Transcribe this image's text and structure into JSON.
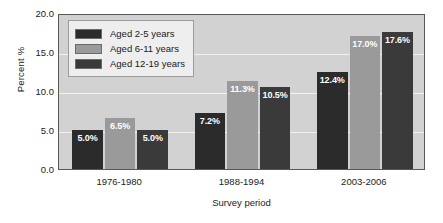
{
  "chart_data": {
    "type": "bar",
    "title": "",
    "xlabel": "Survey period",
    "ylabel": "Percent %",
    "categories": [
      "1976-1980",
      "1988-1994",
      "2003-2006"
    ],
    "series": [
      {
        "name": "Aged 2-5 years",
        "color": "#2b2b2b",
        "values": [
          5.0,
          7.2,
          12.4
        ],
        "labels": [
          "5.0%",
          "7.2%",
          "12.4%"
        ]
      },
      {
        "name": "Aged 6-11 years",
        "color": "#9a9a9a",
        "values": [
          6.5,
          11.3,
          17.0
        ],
        "labels": [
          "6.5%",
          "11.3%",
          "17.0%"
        ]
      },
      {
        "name": "Aged 12-19 years",
        "color": "#3a3a3a",
        "values": [
          5.0,
          10.5,
          17.6
        ],
        "labels": [
          "5.0%",
          "10.5%",
          "17.6%"
        ]
      }
    ],
    "ylim": [
      0.0,
      20.0
    ],
    "yticks": [
      "0.0",
      "5.0",
      "10.0",
      "15.0",
      "20.0"
    ],
    "ytick_values": [
      0.0,
      5.0,
      10.0,
      15.0,
      20.0
    ],
    "grid": "horizontal",
    "legend_position": "top-left-inside",
    "plot_background": "#d2d2d2",
    "gridline_color": "#f2f2f2",
    "label_text_color": "#ffffff"
  },
  "axes": {
    "y_title": "Percent %",
    "x_title": "Survey period"
  },
  "legend": {
    "items": [
      {
        "label": "Aged 2-5 years"
      },
      {
        "label": "Aged 6-11 years"
      },
      {
        "label": "Aged 12-19 years"
      }
    ]
  }
}
